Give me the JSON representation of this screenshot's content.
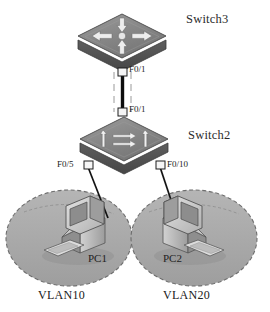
{
  "diagram": {
    "type": "network-topology",
    "background_color": "#ffffff"
  },
  "devices": {
    "switch3": {
      "label": "Switch3",
      "icon": "multilayer-switch-icon",
      "body_color": "#6e6e6e",
      "top_color": "#8a8a8a",
      "side_color": "#4f4f4f"
    },
    "switch2": {
      "label": "Switch2",
      "icon": "switch-icon",
      "body_color": "#6e6e6e",
      "top_color": "#8a8a8a",
      "side_color": "#4f4f4f"
    },
    "pc1": {
      "label": "PC1",
      "icon": "desktop-computer-icon"
    },
    "pc2": {
      "label": "PC2",
      "icon": "desktop-computer-icon"
    }
  },
  "ports": {
    "switch3_uplink": "F0/1",
    "switch2_uplink": "F0/1",
    "switch2_pc1": "F0/5",
    "switch2_pc2": "F0/10"
  },
  "vlans": {
    "vlan10": {
      "label": "VLAN10",
      "fill_color": "#a9a9a9",
      "border_style": "dashed"
    },
    "vlan20": {
      "label": "VLAN20",
      "fill_color": "#a9a9a9",
      "border_style": "dashed"
    }
  },
  "links": [
    {
      "name": "switch3-to-switch2",
      "from": "Switch3",
      "to": "Switch2",
      "from_port": "F0/1",
      "to_port": "F0/1",
      "style": "trunk"
    },
    {
      "name": "switch2-to-pc1",
      "from": "Switch2",
      "to": "PC1",
      "from_port": "F0/5",
      "to_port": "",
      "style": "access"
    },
    {
      "name": "switch2-to-pc2",
      "from": "Switch2",
      "to": "PC2",
      "from_port": "F0/10",
      "to_port": "",
      "style": "access"
    }
  ],
  "colors": {
    "line": "#111111",
    "vlan_fill": "#a9a9a9",
    "vlan_stroke": "#6f6f6f",
    "device_dark": "#4f4f4f",
    "device_mid": "#6e6e6e",
    "device_light": "#8f8f8f",
    "pc_light": "#d8d8d8",
    "pc_mid": "#b4b4b4",
    "pc_dark": "#7a7a7a",
    "screen": "#8c8c8c"
  }
}
